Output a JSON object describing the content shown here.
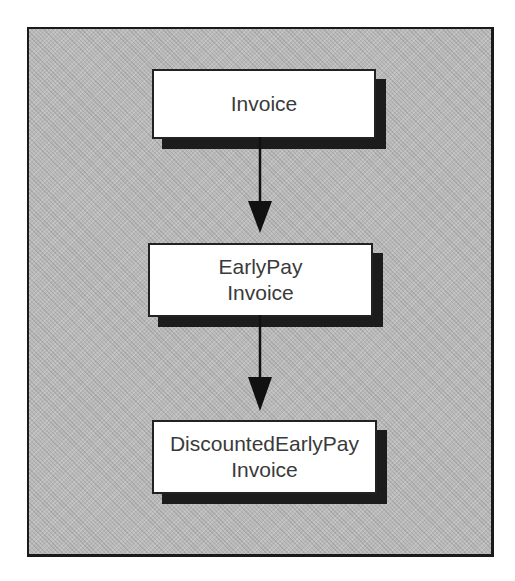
{
  "diagram": {
    "type": "inheritance-chain",
    "nodes": [
      {
        "id": "invoice",
        "lines": [
          "Invoice"
        ]
      },
      {
        "id": "earlypay-invoice",
        "lines": [
          "EarlyPay",
          "Invoice"
        ]
      },
      {
        "id": "discounted-earlypay-invoice",
        "lines": [
          "DiscountedEarlyPay",
          "Invoice"
        ]
      }
    ],
    "edges": [
      {
        "from": "invoice",
        "to": "earlypay-invoice"
      },
      {
        "from": "earlypay-invoice",
        "to": "discounted-earlypay-invoice"
      }
    ],
    "colors": {
      "background": "#b9b9b9",
      "node_fill": "#ffffff",
      "border": "#222222",
      "shadow": "#1c1c1c",
      "text": "#3a3a3a"
    }
  }
}
